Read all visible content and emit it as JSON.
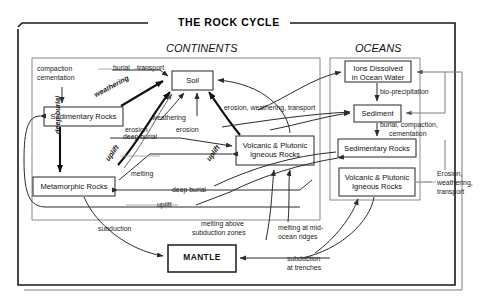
{
  "title": "THE ROCK CYCLE",
  "panels": [
    {
      "id": "continents",
      "label": "CONTINENTS"
    },
    {
      "id": "oceans",
      "label": "OCEANS"
    }
  ],
  "boxes": [
    {
      "id": "soil",
      "label": "Soil",
      "region": "continents"
    },
    {
      "id": "sedimentary_rocks_cont",
      "label": "Sedimentary Rocks",
      "region": "continents"
    },
    {
      "id": "metamorphic_rocks",
      "label": "Metamorphic Rocks",
      "region": "continents"
    },
    {
      "id": "volcanic_plutonic_cont",
      "label_line1": "Volcanic & Plutonic",
      "label_line2": "Igneous Rocks",
      "region": "continents"
    },
    {
      "id": "ions_dissolved",
      "label_line1": "Ions Dissolved",
      "label_line2": "in Ocean Water",
      "region": "oceans"
    },
    {
      "id": "sediment",
      "label": "Sediment",
      "region": "oceans"
    },
    {
      "id": "sedimentary_rocks_ocean",
      "label": "Sedimentary Rocks",
      "region": "oceans"
    },
    {
      "id": "volcanic_plutonic_ocean",
      "label_line1": "Volcanic & Plutonic",
      "label_line2": "Igneous Rocks",
      "region": "oceans"
    },
    {
      "id": "mantle",
      "label": "MANTLE",
      "region": "core"
    }
  ],
  "process_labels": {
    "compaction": "compaction",
    "cementation": "cementation",
    "burial": "burial",
    "transport": "transport",
    "weathering_bold": "weathering",
    "weathering_mid": "weathering",
    "erosion_left": "erosion",
    "erosion_mid": "erosion",
    "erosion_weathering_transport": "erosion, weathering, transport",
    "deep_burial_vert": "deep burial",
    "uplift_left": "uplift",
    "uplift_mid": "uplift",
    "deep_burial_upper": "deep burial",
    "melting": "melting",
    "deep_burial_lower": "deep burial",
    "uplift_lower": "uplift",
    "subduction": "subduction",
    "melting_above_l1": "melting above",
    "melting_above_l2": "subduction zones",
    "melting_ridges_l1": "melting at mid-",
    "melting_ridges_l2": "ocean ridges",
    "subduction_trenches_l1": "subduction",
    "subduction_trenches_l2": "at trenches",
    "bio_precipitation": "bio-precipitation",
    "burial_compaction_l1": "burial, compaction,",
    "burial_compaction_l2": "cementation",
    "erosion_weathering_r1": "Erosion,",
    "erosion_weathering_r2": "weathering,",
    "erosion_weathering_r3": "transport"
  },
  "colors": {
    "frame": "#1a1a1a",
    "panel": "#8a8a8a",
    "arrow": "#2b2b2b",
    "background": "#ffffff"
  }
}
